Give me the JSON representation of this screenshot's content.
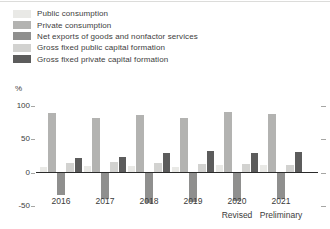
{
  "chart_data": {
    "type": "bar",
    "title": "",
    "ylabel": "%",
    "xlabel": "",
    "grid": false,
    "legend_position": "top-left",
    "ylim": [
      -50,
      100
    ],
    "y_ticks": [
      100,
      50,
      0,
      -50
    ],
    "categories": [
      "2016",
      "2017",
      "2018",
      "2019",
      "2020",
      "2021"
    ],
    "category_sublabels": [
      "",
      "",
      "",
      "",
      "Revised",
      "Preliminary"
    ],
    "series": [
      {
        "name": "Public consumption",
        "color": "#e9e9e6",
        "values": [
          8,
          9,
          9,
          8,
          10,
          10
        ]
      },
      {
        "name": "Private consumption",
        "color": "#b3b3b1",
        "values": [
          88,
          81,
          85,
          81,
          90,
          86
        ]
      },
      {
        "name": "Net exports of goods and nonfactor services",
        "color": "#8f8f8e",
        "values": [
          -33,
          -39,
          -44,
          -43,
          -41,
          -38
        ]
      },
      {
        "name": "Gross fixed public capital formation",
        "color": "#d2d2d0",
        "values": [
          13,
          15,
          13,
          12,
          12,
          11
        ]
      },
      {
        "name": "Gross fixed private capital formation",
        "color": "#5c5c5c",
        "values": [
          21,
          23,
          29,
          32,
          29,
          30
        ]
      }
    ],
    "axis_colors": {
      "text": "#3d3d3d",
      "zero_line": "#2b2b2b",
      "tick": "#a6a6a4"
    }
  }
}
